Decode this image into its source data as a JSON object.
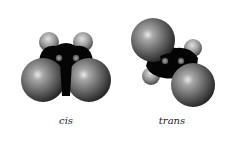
{
  "figure": {
    "type": "space-filling molecular models",
    "background": "#ffffff"
  },
  "colors": {
    "halogen_atom": "#6e6e6e",
    "halogen_highlight": "#e8e8e8",
    "carbon_body": "#050505",
    "carbon_highlight": "#8a8a8a",
    "hydrogen_cap": "#9a9a9a"
  },
  "molecules": [
    {
      "id": "cis",
      "label": "cis",
      "label_pos": {
        "x": 66,
        "y": 115
      },
      "halogens": [
        {
          "cx": 43,
          "cy": 80,
          "r": 22
        },
        {
          "cx": 89,
          "cy": 80,
          "r": 22
        }
      ],
      "hydrogens": [
        {
          "cx": 49,
          "cy": 42,
          "r": 10
        },
        {
          "cx": 83,
          "cy": 42,
          "r": 10
        }
      ],
      "carbons": [
        {
          "cx": 59,
          "cy": 58,
          "r": 3.2
        },
        {
          "cx": 76,
          "cy": 58,
          "r": 3.2
        }
      ]
    },
    {
      "id": "trans",
      "label": "trans",
      "label_pos": {
        "x": 172,
        "y": 115
      },
      "halogens": [
        {
          "cx": 153,
          "cy": 40,
          "r": 22
        },
        {
          "cx": 193,
          "cy": 85,
          "r": 22
        }
      ],
      "hydrogens": [
        {
          "cx": 193,
          "cy": 48,
          "r": 9
        },
        {
          "cx": 151,
          "cy": 76,
          "r": 9
        }
      ],
      "carbons": [
        {
          "cx": 165,
          "cy": 61,
          "r": 3.2
        },
        {
          "cx": 181,
          "cy": 61,
          "r": 3.2
        }
      ]
    }
  ]
}
